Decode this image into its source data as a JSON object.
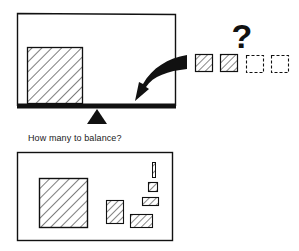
{
  "colors": {
    "ink": "#111111",
    "paper": "#ffffff"
  },
  "top_panel": {
    "name": "balance-scale-panel",
    "left_object": "large-hatched-square",
    "candidates": [
      {
        "kind": "hatched",
        "label": "filled-unit-1"
      },
      {
        "kind": "hatched",
        "label": "filled-unit-2"
      },
      {
        "kind": "dashed",
        "label": "empty-unit-3"
      },
      {
        "kind": "dashed",
        "label": "empty-unit-4"
      }
    ],
    "question_mark": "?",
    "arrow": "curved-arrow-icon"
  },
  "caption": {
    "text": "How many to balance?"
  },
  "bottom_panel": {
    "name": "shapes-panel",
    "shapes": [
      {
        "label": "large-square"
      },
      {
        "label": "medium-rectangle"
      },
      {
        "label": "wide-rectangle"
      },
      {
        "label": "flat-rectangle"
      },
      {
        "label": "small-square"
      },
      {
        "label": "thin-bar"
      }
    ]
  }
}
